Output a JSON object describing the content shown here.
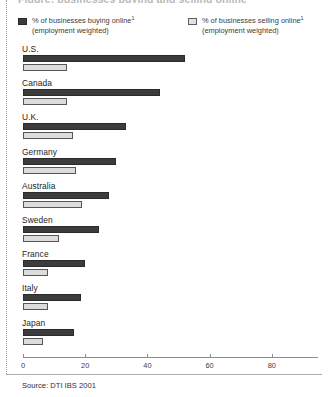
{
  "figure": {
    "title_clipped": "Figure: businesses buying and selling online",
    "source_label": "Source:",
    "source_value": "DTI IBS 2001",
    "source_text": "Source: DTI IBS 2001"
  },
  "legend": {
    "items": [
      {
        "key": "buying",
        "swatch": "dark-swatch",
        "line1": "% of  businesses buying online",
        "footnote": "1",
        "line2": "(employment weighted)",
        "color": "#3c3c3c"
      },
      {
        "key": "selling",
        "swatch": "light-swatch",
        "line1": "% of businesses selling online",
        "footnote": "1",
        "line2": "(employment weighted)",
        "color": "#dcdcdc"
      }
    ]
  },
  "axis": {
    "ticks": [
      "0",
      "20",
      "40",
      "60",
      "80"
    ],
    "tick_values": [
      0,
      20,
      40,
      60,
      80
    ]
  },
  "chart_data": {
    "type": "bar",
    "orientation": "horizontal",
    "title": "",
    "xlabel": "",
    "ylabel": "",
    "xlim": [
      0,
      95
    ],
    "grid": false,
    "legend_position": "top",
    "categories": [
      "U.S.",
      "Canada",
      "U.K.",
      "Germany",
      "Australia",
      "Sweden",
      "France",
      "Italy",
      "Japan"
    ],
    "series": [
      {
        "name": "% of  businesses buying online (employment weighted)",
        "color": "#3c3c3c",
        "values": [
          52,
          44,
          33,
          30,
          27.5,
          24.5,
          20,
          18.5,
          16.5
        ]
      },
      {
        "name": "% of businesses selling online (employment weighted)",
        "color": "#dcdcdc",
        "values": [
          14,
          14,
          16,
          17,
          19,
          11.5,
          8,
          8,
          6.5
        ]
      }
    ]
  }
}
